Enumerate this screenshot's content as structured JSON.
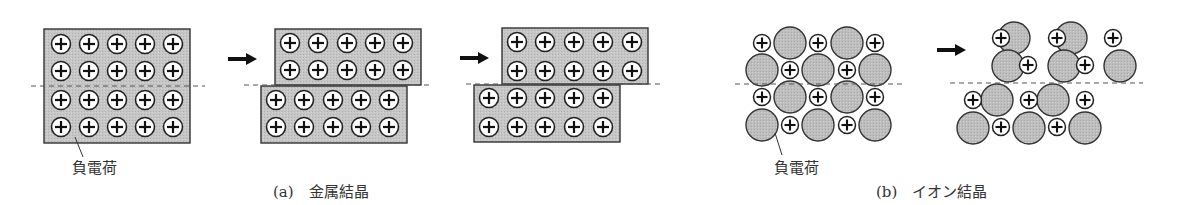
{
  "figure": {
    "colors": {
      "block_fill": "#c4c4c4",
      "block_stroke": "#333333",
      "anion_fill": "#bdbdbd",
      "cation_fill": "#ffffff",
      "line": "#222222",
      "dashed": "#555555",
      "text": "#333333"
    },
    "panel_a": {
      "caption": "(a)　金属結晶",
      "annotation": "負電荷",
      "cation_symbol": "+",
      "stages": [
        "before-slip",
        "half-slip",
        "full-slip"
      ],
      "grid": {
        "rows": 4,
        "cols": 5
      }
    },
    "panel_b": {
      "caption": "(b)　イオン結晶",
      "annotation": "負電荷",
      "cation_symbol": "+",
      "stages": [
        "before-slip",
        "after-slip"
      ],
      "grid": {
        "rows": 4,
        "cols": 5
      }
    },
    "arrows": [
      {
        "from": "a-stage1",
        "to": "a-stage2",
        "icon": "right-arrow-icon"
      },
      {
        "from": "a-stage2",
        "to": "a-stage3",
        "icon": "right-arrow-icon"
      },
      {
        "from": "b-stage1",
        "to": "b-stage2",
        "icon": "right-arrow-icon"
      }
    ]
  }
}
